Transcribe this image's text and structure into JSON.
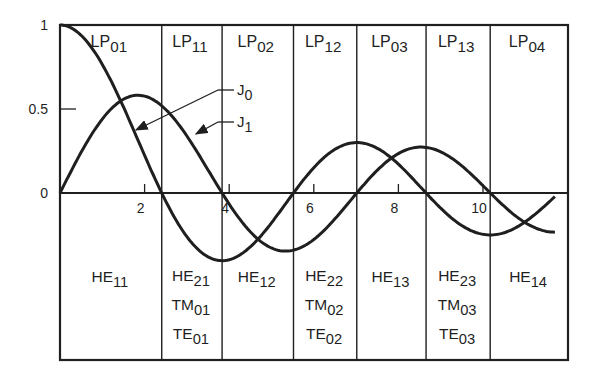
{
  "chart_data": {
    "type": "line",
    "title": "",
    "xlabel": "",
    "ylabel": "",
    "xlim": [
      0,
      11.7
    ],
    "ylim": [
      -0.4,
      1.0
    ],
    "x_ticks": [
      2,
      4,
      6,
      8,
      10
    ],
    "y_ticks": [
      {
        "value": 0,
        "label": "0"
      },
      {
        "value": 0.5,
        "label": "0.5"
      },
      {
        "value": 1,
        "label": "1"
      }
    ],
    "series": [
      {
        "name": "J0",
        "label": "J",
        "sub": "0",
        "function": "bessel_j0",
        "x_range": [
          0,
          11.7
        ]
      },
      {
        "name": "J1",
        "label": "J",
        "sub": "1",
        "function": "bessel_j1",
        "x_range": [
          0,
          11.7
        ]
      }
    ],
    "cutoff_lines": [
      2.405,
      3.832,
      5.52,
      7.016,
      8.654,
      10.17
    ],
    "regions": [
      {
        "top": {
          "base": "LP",
          "sub": "01"
        },
        "bottom": [
          {
            "base": "HE",
            "sub": "11"
          }
        ]
      },
      {
        "top": {
          "base": "LP",
          "sub": "11"
        },
        "bottom": [
          {
            "base": "HE",
            "sub": "21"
          },
          {
            "base": "TM",
            "sub": "01"
          },
          {
            "base": "TE",
            "sub": "01"
          }
        ]
      },
      {
        "top": {
          "base": "LP",
          "sub": "02"
        },
        "bottom": [
          {
            "base": "HE",
            "sub": "12"
          }
        ]
      },
      {
        "top": {
          "base": "LP",
          "sub": "12"
        },
        "bottom": [
          {
            "base": "HE",
            "sub": "22"
          },
          {
            "base": "TM",
            "sub": "02"
          },
          {
            "base": "TE",
            "sub": "02"
          }
        ]
      },
      {
        "top": {
          "base": "LP",
          "sub": "03"
        },
        "bottom": [
          {
            "base": "HE",
            "sub": "13"
          }
        ]
      },
      {
        "top": {
          "base": "LP",
          "sub": "13"
        },
        "bottom": [
          {
            "base": "HE",
            "sub": "23"
          },
          {
            "base": "TM",
            "sub": "03"
          },
          {
            "base": "TE",
            "sub": "03"
          }
        ]
      },
      {
        "top": {
          "base": "LP",
          "sub": "04"
        },
        "bottom": [
          {
            "base": "HE",
            "sub": "14"
          }
        ]
      }
    ],
    "annotations": [
      {
        "text": "J",
        "sub": "0",
        "points_to": "J0 curve",
        "arrow_target_v": 2.0
      },
      {
        "text": "J",
        "sub": "1",
        "points_to": "J1 curve",
        "arrow_target_v": 3.1
      }
    ],
    "grid": false,
    "legend": "inline callouts"
  },
  "colors": {
    "ink": "#1f1f1f",
    "background": "#ffffff"
  }
}
